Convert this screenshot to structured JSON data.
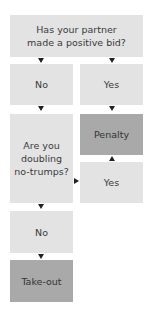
{
  "flowchart": {
    "question1": "Has your partner made a positive bid?",
    "answer1_no": "No",
    "answer1_yes": "Yes",
    "question2": "Are you doubling no-trumps?",
    "result_penalty": "Penalty",
    "answer2_yes": "Yes",
    "answer2_no": "No",
    "result_takeout": "Take-out"
  },
  "colors": {
    "light_box": "#e3e3e3",
    "dark_box": "#a9a9a9",
    "arrow": "#222222"
  }
}
